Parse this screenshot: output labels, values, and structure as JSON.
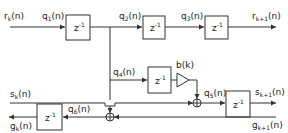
{
  "diagram": {
    "type": "signal-flow block diagram (lattice filter stage)",
    "signals": {
      "r_in": "r",
      "r_in_sub": "k",
      "q1": "q",
      "q1_sub": "1",
      "q2": "q",
      "q2_sub": "2",
      "q3": "q",
      "q3_sub": "3",
      "q4": "q",
      "q4_sub": "4",
      "q5": "q",
      "q5_sub": "5",
      "q6": "q",
      "q6_sub": "6",
      "r_out": "r",
      "r_out_sub": "k+1",
      "s_in": "s",
      "s_in_sub": "k",
      "s_out": "s",
      "s_out_sub": "k+1",
      "g_out": "g",
      "g_out_sub": "k",
      "g_in": "g",
      "g_in_sub": "k+1",
      "arg": "(n)"
    },
    "gain": {
      "label": "b(k)"
    },
    "delay_blocks": [
      {
        "label": "z",
        "exp": "-1"
      },
      {
        "label": "z",
        "exp": "-1"
      },
      {
        "label": "z",
        "exp": "-1"
      },
      {
        "label": "z",
        "exp": "-1"
      },
      {
        "label": "z",
        "exp": "-1"
      },
      {
        "label": "z",
        "exp": "-1"
      }
    ],
    "adder_symbol": "+"
  }
}
